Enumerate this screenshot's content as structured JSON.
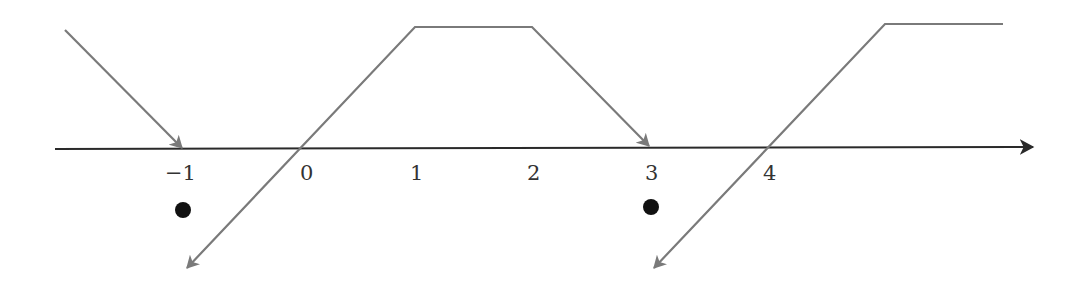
{
  "diagram": {
    "type": "number-line-arrow-diagram",
    "colors": {
      "axis": "#2a2a2a",
      "arrow_path": "#7a7a7a",
      "dot": "#111111",
      "background": "#ffffff"
    },
    "axis": {
      "y": 149,
      "x_start": 55,
      "x_end": 1035,
      "direction": "right"
    },
    "ticks": [
      {
        "label": "−1",
        "value": -1,
        "x": 183
      },
      {
        "label": "0",
        "value": 0,
        "x": 300
      },
      {
        "label": "1",
        "value": 1,
        "x": 416
      },
      {
        "label": "2",
        "value": 2,
        "x": 533
      },
      {
        "label": "3",
        "value": 3,
        "x": 650
      },
      {
        "label": "4",
        "value": 4,
        "x": 768
      }
    ],
    "paths": [
      {
        "name": "incoming-arrow-to-minus-1",
        "points": "65,30 183,149",
        "arrowhead_at": "end"
      },
      {
        "name": "trapezoid-arrow-0-to-3",
        "points": "187,268 415,27 532,27 650,147",
        "arrowhead_at": "both"
      },
      {
        "name": "ramp-arrow-from-4",
        "points": "654,268 885,24 1003,24",
        "arrowhead_at": "start"
      }
    ],
    "dots": [
      {
        "name": "dot-below-minus-1",
        "x": 183,
        "y": 210
      },
      {
        "name": "dot-below-3",
        "x": 651,
        "y": 207
      }
    ]
  }
}
